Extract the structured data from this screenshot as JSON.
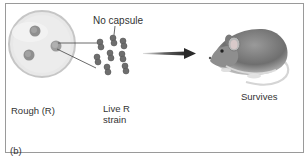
{
  "figure": {
    "panel_label": "(b)",
    "petri_dish": {
      "label": "Rough (R)",
      "colony_count": 3
    },
    "bacteria": {
      "callout": "No capsule",
      "label_line1": "Live R",
      "label_line2": "strain",
      "cell_count": 10
    },
    "arrow": {
      "direction": "right"
    },
    "mouse": {
      "outcome": "Survives"
    }
  },
  "colors": {
    "border": "#9a9a9a",
    "dish_fill": "#e6e6e6",
    "dish_rim": "#c8c8c8",
    "colony": "#8c8c8c",
    "bacteria": "#6e6e6e",
    "arrow": "#3a3a3a",
    "text": "#333333"
  }
}
